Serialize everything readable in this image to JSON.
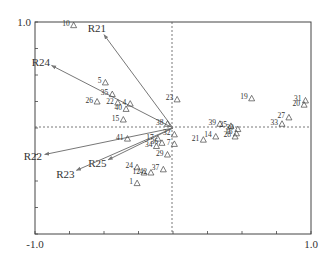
{
  "chart_data": {
    "type": "scatter",
    "subtype": "biplot",
    "title": "",
    "xlabel": "",
    "ylabel": "",
    "xlim": [
      -1.0,
      1.0
    ],
    "ylim": [
      -1.0,
      1.0
    ],
    "x_tick_labels": [
      "-1.0",
      "1.0"
    ],
    "y_tick_labels": [
      "1.0"
    ],
    "x_ticks": [
      -1.0,
      -0.75,
      -0.5,
      -0.25,
      0,
      0.25,
      0.5,
      0.75,
      1.0
    ],
    "y_ticks": [
      -1.0,
      -0.75,
      -0.5,
      -0.25,
      0,
      0.25,
      0.5,
      0.75,
      1.0
    ],
    "grid": false,
    "zero_lines": "dashed",
    "legend": null,
    "vectors": [
      {
        "name": "R21",
        "x": -0.5,
        "y": 0.88
      },
      {
        "name": "R24",
        "x": -0.88,
        "y": 0.59
      },
      {
        "name": "R22",
        "x": -0.93,
        "y": -0.25
      },
      {
        "name": "R25",
        "x": -0.47,
        "y": -0.3
      },
      {
        "name": "R23",
        "x": -0.7,
        "y": -0.4
      }
    ],
    "points": [
      {
        "label": "10",
        "x": -0.72,
        "y": 0.97
      },
      {
        "label": "5",
        "x": -0.49,
        "y": 0.43
      },
      {
        "label": "35",
        "x": -0.44,
        "y": 0.32
      },
      {
        "label": "26",
        "x": -0.55,
        "y": 0.25
      },
      {
        "label": "22",
        "x": -0.4,
        "y": 0.24
      },
      {
        "label": "4",
        "x": -0.31,
        "y": 0.23
      },
      {
        "label": "40",
        "x": -0.34,
        "y": 0.18
      },
      {
        "label": "15",
        "x": -0.36,
        "y": 0.08
      },
      {
        "label": "23",
        "x": 0.03,
        "y": 0.27
      },
      {
        "label": "38",
        "x": -0.04,
        "y": 0.04
      },
      {
        "label": "17",
        "x": -0.11,
        "y": -0.1
      },
      {
        "label": "41",
        "x": -0.33,
        "y": -0.1
      },
      {
        "label": "36",
        "x": -0.08,
        "y": -0.14
      },
      {
        "label": "34",
        "x": -0.12,
        "y": -0.17
      },
      {
        "label": "32",
        "x": 0.01,
        "y": -0.06
      },
      {
        "label": "7",
        "x": 0.01,
        "y": -0.15
      },
      {
        "label": "29",
        "x": -0.04,
        "y": -0.25
      },
      {
        "label": "24",
        "x": -0.26,
        "y": -0.37
      },
      {
        "label": "12",
        "x": -0.21,
        "y": -0.42
      },
      {
        "label": "42",
        "x": -0.16,
        "y": -0.42
      },
      {
        "label": "37",
        "x": -0.07,
        "y": -0.39
      },
      {
        "label": "1",
        "x": -0.26,
        "y": -0.52
      },
      {
        "label": "19",
        "x": 0.57,
        "y": 0.28
      },
      {
        "label": "31",
        "x": 0.96,
        "y": 0.26
      },
      {
        "label": "20",
        "x": 0.95,
        "y": 0.22
      },
      {
        "label": "27",
        "x": 0.84,
        "y": 0.1
      },
      {
        "label": "33",
        "x": 0.79,
        "y": 0.04
      },
      {
        "label": "39",
        "x": 0.34,
        "y": 0.04
      },
      {
        "label": "25",
        "x": 0.42,
        "y": 0.02
      },
      {
        "label": "30",
        "x": 0.47,
        "y": -0.01
      },
      {
        "label": "16",
        "x": 0.46,
        "y": -0.05
      },
      {
        "label": "28",
        "x": 0.45,
        "y": -0.08
      },
      {
        "label": "21",
        "x": 0.22,
        "y": -0.11
      },
      {
        "label": "14",
        "x": 0.31,
        "y": -0.08
      }
    ]
  },
  "axis_labels": {
    "x_min": "-1.0",
    "x_max": "1.0",
    "y_max": "1.0"
  }
}
